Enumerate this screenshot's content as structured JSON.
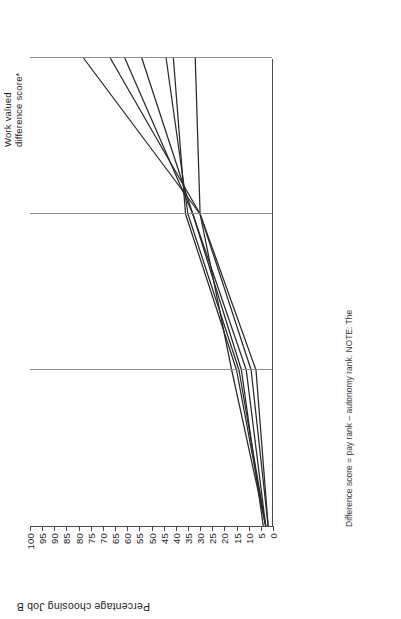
{
  "chart_data": {
    "type": "line",
    "title": "",
    "xlabel": "",
    "ylabel": "Percentage choosing Job B",
    "ylim": [
      0,
      100
    ],
    "yticks": [
      0,
      5,
      10,
      15,
      20,
      25,
      30,
      35,
      40,
      45,
      50,
      55,
      60,
      65,
      70,
      75,
      80,
      85,
      90,
      95,
      100
    ],
    "grid": "vertical-only",
    "legend_position": "right-of-plot",
    "legend_title": [
      "Work valued",
      "difference score*"
    ],
    "legend_title_flat": "Work valued difference score*",
    "categories": [
      "Job A and B: Equal pay / Job A: High autonomy / Job B: Low autonomy",
      "Job A: High autonomy / Job B: Low autonomy 10% more pay than Job A",
      "Job A: High autonomy / Job B: Low autonomy 30% more pay than Job A",
      "Job A: High autonomy / Job B: Low autonomy 50% more pay than Job A"
    ],
    "x_group_labels": [
      {
        "lines": [
          "Job A and B: Equal pay",
          "Job A : High autonomy",
          "Job B : Low autonomy"
        ]
      },
      {
        "lines": [
          "Job A : High autonomy",
          "Job B : Low autonomy",
          "10% more pay",
          "than Job A"
        ]
      },
      {
        "lines": [
          "Job A : High autonomy",
          "Job B : Low autonomy",
          "30% more pay",
          "than Job A"
        ]
      },
      {
        "lines": [
          "Job A : High autonomy",
          "Job B : Low autonomy",
          "50% more pay",
          "than Job A"
        ]
      }
    ],
    "pole_labels": {
      "top": "High pay",
      "bottom": "High autonomy"
    },
    "series": [
      {
        "name": "7 – 10",
        "values": [
          2,
          7,
          30,
          78
        ]
      },
      {
        "name": "4 – 6",
        "values": [
          2,
          9,
          30,
          67
        ]
      },
      {
        "name": "2 – 3",
        "values": [
          3,
          11,
          33,
          61
        ]
      },
      {
        "name": "–1 to 1",
        "values": [
          4,
          13,
          33,
          54
        ]
      },
      {
        "name": "– 2 – –3",
        "values": [
          3,
          14,
          35,
          44
        ]
      },
      {
        "name": "– 4 – –6",
        "values": [
          3,
          15,
          36,
          41
        ]
      },
      {
        "name": "– 7 – –10",
        "values": [
          3,
          17,
          30,
          32
        ]
      }
    ],
    "footnote": "Difference score = pay rank – autonomy rank.  NOTE: The"
  },
  "axis": {
    "y_title": "Percentage choosing Job B"
  },
  "legend": {
    "title_line1": "Work valued",
    "title_line2": "difference score*",
    "high_pay": "High pay",
    "high_autonomy": "High autonomy"
  }
}
